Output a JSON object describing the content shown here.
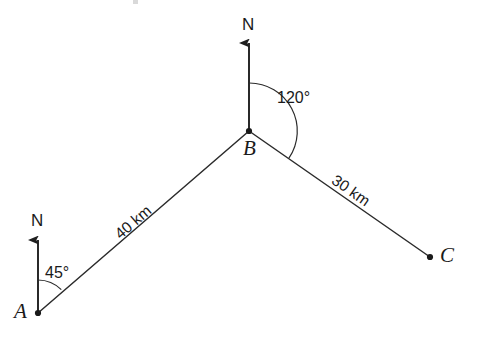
{
  "diagram": {
    "type": "bearing-vector-diagram",
    "background_color": "#ffffff",
    "line_color": "#2b2b2b",
    "text_color": "#1a1a1a",
    "points": [
      {
        "id": "A",
        "label": "A",
        "x": 38,
        "y": 313
      },
      {
        "id": "B",
        "label": "B",
        "x": 249,
        "y": 131
      },
      {
        "id": "C",
        "label": "C",
        "x": 430,
        "y": 257
      }
    ],
    "segments": [
      {
        "id": "AB",
        "from": "A",
        "to": "B",
        "distance_label": "40 km"
      },
      {
        "id": "BC",
        "from": "B",
        "to": "C",
        "distance_label": "30 km"
      }
    ],
    "north_arrows": [
      {
        "id": "north-at-A",
        "label": "N",
        "base_x": 38,
        "base_y": 313,
        "tip_y": 237
      },
      {
        "id": "north-at-B",
        "label": "N",
        "base_x": 249,
        "base_y": 131,
        "tip_y": 40
      }
    ],
    "angles": [
      {
        "id": "angle-at-A",
        "label": "45°",
        "vertex": "A",
        "value": 45,
        "unit": "degrees"
      },
      {
        "id": "angle-at-B",
        "label": "120°",
        "vertex": "B",
        "value": 120,
        "unit": "degrees"
      }
    ]
  }
}
